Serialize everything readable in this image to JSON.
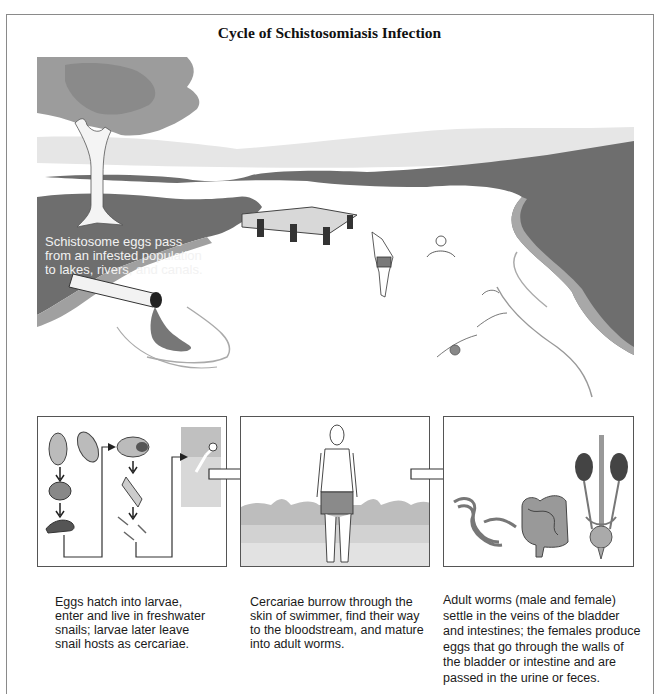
{
  "title": "Cycle of Schistosomiasis Infection",
  "scene": {
    "caption": "Schistosome eggs pass\nfrom an infested population\nto lakes, rivers, and canals.",
    "elements": [
      "tree",
      "land",
      "water",
      "dock",
      "diving-swimmer",
      "wading-swimmer",
      "swimming-person",
      "discharge-pipe"
    ]
  },
  "panels": [
    {
      "name": "snail-stage",
      "elements": [
        "eggs",
        "miracidium",
        "snail",
        "sporocysts",
        "cercariae"
      ],
      "caption": "Eggs hatch into larvae,\nenter and live in freshwater\nsnails; larvae later leave\nsnail hosts as cercariae."
    },
    {
      "name": "human-infection",
      "elements": [
        "standing-swimmer",
        "water"
      ],
      "caption": "Cercariae burrow through the\nskin of swimmer, find their way\nto the bloodstream, and mature\ninto adult worms."
    },
    {
      "name": "adult-worms",
      "elements": [
        "worm-pair",
        "intestines",
        "kidneys-bladder"
      ],
      "caption": "Adult worms (male and female)\nsettle in the veins of the bladder\nand intestines; the females produce\neggs that go through the walls of\nthe bladder or intestine and are\npassed in the urine or feces."
    }
  ],
  "colors": {
    "land_dark": "#6e6e6e",
    "land_mid": "#8f8f8f",
    "shore": "#a8a8a8",
    "tree_canopy": "#9c9c9c",
    "sky_haze": "#e4e4e4",
    "frame": "#8a8a8a"
  }
}
